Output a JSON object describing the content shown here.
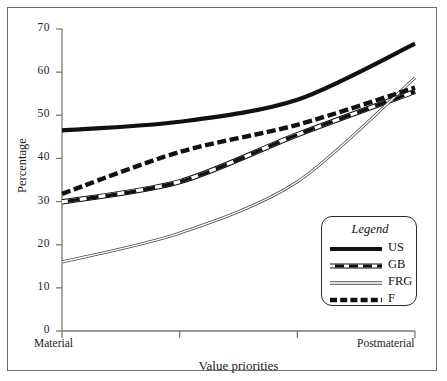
{
  "figure": {
    "y_axis_title": "Percentage",
    "x_axis_title": "Value priorities",
    "x_left_label": "Material",
    "x_right_label": "Postmaterial"
  },
  "legend": {
    "title": "Legend",
    "entries": [
      {
        "label": "US",
        "style": "thick-solid"
      },
      {
        "label": "GB",
        "style": "thick-dash-outline"
      },
      {
        "label": "FRG",
        "style": "thin-double"
      },
      {
        "label": "F",
        "style": "thick-dash"
      }
    ]
  },
  "y_ticks": [
    {
      "label": "0",
      "value": 0
    },
    {
      "label": "10",
      "value": 10
    },
    {
      "label": "20",
      "value": 20
    },
    {
      "label": "30",
      "value": 30
    },
    {
      "label": "40",
      "value": 40
    },
    {
      "label": "50",
      "value": 50
    },
    {
      "label": "60",
      "value": 60
    },
    {
      "label": "70",
      "value": 70
    }
  ],
  "chart_data": {
    "type": "line",
    "title": "",
    "xlabel": "Value priorities",
    "ylabel": "Percentage",
    "x": [
      1,
      2,
      3,
      4
    ],
    "x_tick_labels": [
      "Material",
      "",
      "",
      "Postmaterial"
    ],
    "ylim": [
      0,
      70
    ],
    "y_ticks": [
      0,
      10,
      20,
      30,
      40,
      50,
      60,
      70
    ],
    "grid": false,
    "legend_position": "lower-right-inside",
    "series": [
      {
        "name": "US",
        "style": "thick-solid",
        "values": [
          46.5,
          48.5,
          53.6,
          66.6
        ]
      },
      {
        "name": "GB",
        "style": "thick-dash-outline",
        "values": [
          29.9,
          34.6,
          45.5,
          55.5
        ]
      },
      {
        "name": "FRG",
        "style": "thin-double",
        "values": [
          16.0,
          22.7,
          34.6,
          58.7
        ]
      },
      {
        "name": "F",
        "style": "thick-dash",
        "values": [
          31.8,
          41.5,
          47.8,
          56.4
        ]
      }
    ]
  },
  "colors": {
    "line": "#111111",
    "axis": "#7a7a7a",
    "frame": "#6f6f6f",
    "text": "#1c1c1c"
  }
}
